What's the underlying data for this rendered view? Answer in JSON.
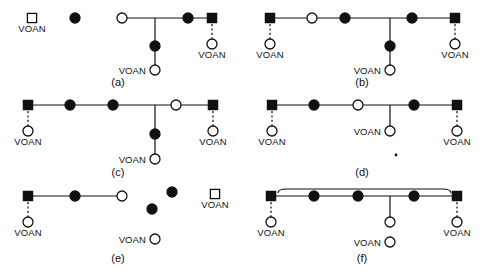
{
  "figure": {
    "title": "",
    "symbol_legend": {
      "filled-circle": "affected female",
      "open-circle": "unaffected female",
      "filled-square": "affected male",
      "open-square": "unaffected male"
    },
    "colors": {
      "stroke": "#111111",
      "fill_dark": "#111111",
      "fill_light": "#ffffff",
      "background": "#ffffff"
    },
    "node_label_text": "VOAN",
    "panels": [
      {
        "id": "a",
        "caption": "(a)",
        "caption_x": 118,
        "caption_y": 86,
        "baseline_y": 18,
        "spouse_lines": [
          {
            "x1": 122,
            "x2": 212,
            "y": 18
          }
        ],
        "descent_lines": [
          {
            "x": 155,
            "y1": 18,
            "y2": 67
          }
        ],
        "dotted_lines": [
          {
            "x": 212,
            "y1": 24,
            "y2": 39
          }
        ],
        "nodes": [
          {
            "shape": "open-square",
            "x": 32,
            "y": 18,
            "label": "VOAN",
            "label_pos": "below"
          },
          {
            "shape": "filled-circle",
            "x": 75,
            "y": 18,
            "label": "",
            "label_pos": "none"
          },
          {
            "shape": "open-circle",
            "x": 122,
            "y": 18,
            "label": "",
            "label_pos": "none"
          },
          {
            "shape": "filled-circle",
            "x": 188,
            "y": 18,
            "label": "",
            "label_pos": "none"
          },
          {
            "shape": "filled-square",
            "x": 212,
            "y": 18,
            "label": "",
            "label_pos": "none"
          },
          {
            "shape": "open-circle",
            "x": 212,
            "y": 44,
            "label": "VOAN",
            "label_pos": "below"
          },
          {
            "shape": "filled-circle",
            "x": 155,
            "y": 46,
            "label": "",
            "label_pos": "none"
          },
          {
            "shape": "open-circle",
            "x": 155,
            "y": 70,
            "label": "VOAN",
            "label_pos": "left"
          }
        ]
      },
      {
        "id": "b",
        "caption": "(b)",
        "caption_x": 362,
        "caption_y": 86,
        "baseline_y": 18,
        "spouse_lines": [
          {
            "x1": 270,
            "x2": 455,
            "y": 18
          }
        ],
        "descent_lines": [
          {
            "x": 390,
            "y1": 18,
            "y2": 67
          }
        ],
        "dotted_lines": [
          {
            "x": 270,
            "y1": 24,
            "y2": 39
          },
          {
            "x": 455,
            "y1": 24,
            "y2": 39
          }
        ],
        "nodes": [
          {
            "shape": "filled-square",
            "x": 270,
            "y": 18,
            "label": "",
            "label_pos": "none"
          },
          {
            "shape": "open-circle",
            "x": 270,
            "y": 44,
            "label": "VOAN",
            "label_pos": "below"
          },
          {
            "shape": "open-circle",
            "x": 312,
            "y": 18,
            "label": "",
            "label_pos": "none"
          },
          {
            "shape": "filled-circle",
            "x": 345,
            "y": 18,
            "label": "",
            "label_pos": "none"
          },
          {
            "shape": "filled-circle",
            "x": 412,
            "y": 18,
            "label": "",
            "label_pos": "none"
          },
          {
            "shape": "filled-square",
            "x": 455,
            "y": 18,
            "label": "",
            "label_pos": "none"
          },
          {
            "shape": "open-circle",
            "x": 455,
            "y": 44,
            "label": "VOAN",
            "label_pos": "below"
          },
          {
            "shape": "filled-circle",
            "x": 390,
            "y": 46,
            "label": "",
            "label_pos": "none"
          },
          {
            "shape": "open-circle",
            "x": 390,
            "y": 70,
            "label": "VOAN",
            "label_pos": "left"
          }
        ]
      },
      {
        "id": "c",
        "caption": "(c)",
        "caption_x": 118,
        "caption_y": 176,
        "baseline_y": 105,
        "spouse_lines": [
          {
            "x1": 28,
            "x2": 213,
            "y": 105
          }
        ],
        "descent_lines": [
          {
            "x": 155,
            "y1": 105,
            "y2": 156
          }
        ],
        "dotted_lines": [
          {
            "x": 28,
            "y1": 111,
            "y2": 126
          },
          {
            "x": 213,
            "y1": 111,
            "y2": 126
          }
        ],
        "nodes": [
          {
            "shape": "filled-square",
            "x": 28,
            "y": 105,
            "label": "",
            "label_pos": "none"
          },
          {
            "shape": "open-circle",
            "x": 28,
            "y": 131,
            "label": "VOAN",
            "label_pos": "below"
          },
          {
            "shape": "filled-circle",
            "x": 70,
            "y": 105,
            "label": "",
            "label_pos": "none"
          },
          {
            "shape": "filled-circle",
            "x": 113,
            "y": 105,
            "label": "",
            "label_pos": "none"
          },
          {
            "shape": "open-circle",
            "x": 176,
            "y": 105,
            "label": "",
            "label_pos": "none"
          },
          {
            "shape": "filled-square",
            "x": 213,
            "y": 105,
            "label": "",
            "label_pos": "none"
          },
          {
            "shape": "open-circle",
            "x": 213,
            "y": 131,
            "label": "VOAN",
            "label_pos": "below"
          },
          {
            "shape": "filled-circle",
            "x": 155,
            "y": 134,
            "label": "",
            "label_pos": "none"
          },
          {
            "shape": "open-circle",
            "x": 155,
            "y": 159,
            "label": "VOAN",
            "label_pos": "left"
          }
        ]
      },
      {
        "id": "d",
        "caption": "(d)",
        "caption_x": 362,
        "caption_y": 176,
        "baseline_y": 105,
        "spouse_lines": [
          {
            "x1": 272,
            "x2": 457,
            "y": 105
          }
        ],
        "descent_lines": [
          {
            "x": 390,
            "y1": 105,
            "y2": 128
          }
        ],
        "dotted_lines": [
          {
            "x": 272,
            "y1": 111,
            "y2": 126
          },
          {
            "x": 457,
            "y1": 111,
            "y2": 126
          }
        ],
        "stray_dots": [
          {
            "x": 396,
            "y": 155,
            "r": 1.4
          }
        ],
        "nodes": [
          {
            "shape": "filled-square",
            "x": 272,
            "y": 105,
            "label": "",
            "label_pos": "none"
          },
          {
            "shape": "open-circle",
            "x": 272,
            "y": 131,
            "label": "VOAN",
            "label_pos": "below"
          },
          {
            "shape": "filled-circle",
            "x": 314,
            "y": 105,
            "label": "",
            "label_pos": "none"
          },
          {
            "shape": "open-circle",
            "x": 358,
            "y": 105,
            "label": "",
            "label_pos": "none"
          },
          {
            "shape": "filled-circle",
            "x": 414,
            "y": 105,
            "label": "",
            "label_pos": "none"
          },
          {
            "shape": "filled-square",
            "x": 457,
            "y": 105,
            "label": "",
            "label_pos": "none"
          },
          {
            "shape": "open-circle",
            "x": 457,
            "y": 131,
            "label": "VOAN",
            "label_pos": "below"
          },
          {
            "shape": "open-circle",
            "x": 390,
            "y": 131,
            "label": "VOAN",
            "label_pos": "left"
          }
        ]
      },
      {
        "id": "e",
        "caption": "(e)",
        "caption_x": 118,
        "caption_y": 262,
        "baseline_y": 196,
        "spouse_lines": [
          {
            "x1": 28,
            "x2": 122,
            "y": 196
          }
        ],
        "descent_lines": [],
        "dotted_lines": [
          {
            "x": 28,
            "y1": 202,
            "y2": 217
          }
        ],
        "nodes": [
          {
            "shape": "filled-square",
            "x": 28,
            "y": 196,
            "label": "",
            "label_pos": "none"
          },
          {
            "shape": "open-circle",
            "x": 28,
            "y": 222,
            "label": "VOAN",
            "label_pos": "below"
          },
          {
            "shape": "filled-circle",
            "x": 75,
            "y": 196,
            "label": "",
            "label_pos": "none"
          },
          {
            "shape": "open-circle",
            "x": 122,
            "y": 196,
            "label": "",
            "label_pos": "none"
          },
          {
            "shape": "filled-circle",
            "x": 172,
            "y": 192,
            "label": "",
            "label_pos": "none"
          },
          {
            "shape": "filled-circle",
            "x": 152,
            "y": 209,
            "label": "",
            "label_pos": "none"
          },
          {
            "shape": "open-square",
            "x": 215,
            "y": 194,
            "label": "VOAN",
            "label_pos": "below"
          },
          {
            "shape": "open-circle",
            "x": 155,
            "y": 239,
            "label": "VOAN",
            "label_pos": "left"
          }
        ]
      },
      {
        "id": "f",
        "caption": "(f)",
        "caption_x": 362,
        "caption_y": 262,
        "baseline_y": 196,
        "spouse_lines": [
          {
            "x1": 271,
            "x2": 457,
            "y": 196
          }
        ],
        "descent_lines": [
          {
            "x": 390,
            "y1": 196,
            "y2": 217
          }
        ],
        "dotted_lines": [
          {
            "x": 271,
            "y1": 202,
            "y2": 217
          },
          {
            "x": 457,
            "y1": 202,
            "y2": 217
          }
        ],
        "brace": {
          "x1": 278,
          "x2": 451,
          "y_line": 189,
          "y_tip": 193
        },
        "nodes": [
          {
            "shape": "filled-square",
            "x": 271,
            "y": 196,
            "label": "",
            "label_pos": "none"
          },
          {
            "shape": "open-circle",
            "x": 271,
            "y": 222,
            "label": "VOAN",
            "label_pos": "below"
          },
          {
            "shape": "filled-circle",
            "x": 314,
            "y": 196,
            "label": "",
            "label_pos": "none"
          },
          {
            "shape": "filled-circle",
            "x": 358,
            "y": 196,
            "label": "",
            "label_pos": "none"
          },
          {
            "shape": "filled-circle",
            "x": 414,
            "y": 196,
            "label": "",
            "label_pos": "none"
          },
          {
            "shape": "filled-square",
            "x": 457,
            "y": 196,
            "label": "",
            "label_pos": "none"
          },
          {
            "shape": "open-circle",
            "x": 457,
            "y": 222,
            "label": "VOAN",
            "label_pos": "below"
          },
          {
            "shape": "open-circle",
            "x": 390,
            "y": 222,
            "label": "",
            "label_pos": "none"
          },
          {
            "shape": "open-circle",
            "x": 390,
            "y": 242,
            "label": "VOAN",
            "label_pos": "left"
          }
        ]
      }
    ]
  }
}
